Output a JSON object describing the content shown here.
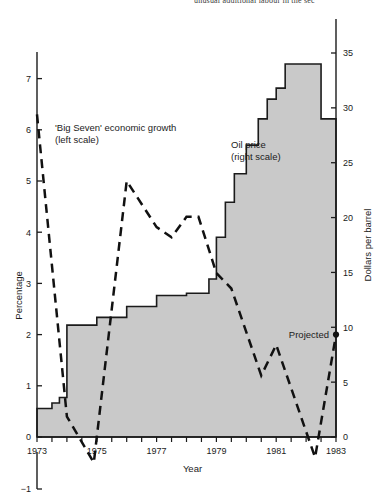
{
  "header": {
    "clipped_text": "unusual additional labour in the sec"
  },
  "chart_data": {
    "type": "area",
    "title": "",
    "xlabel": "Year",
    "ylabel": "Percentage",
    "y2label": "Dollars per barrel",
    "grid": false,
    "legend_position": "inline-annotations",
    "x": [
      1973,
      1974,
      1975,
      1976,
      1977,
      1978,
      1979,
      1980,
      1981,
      1982,
      1983
    ],
    "xlim": [
      1973,
      1983
    ],
    "xtick_labels": [
      "1973",
      "1975",
      "1977",
      "1979",
      "1981",
      "1983"
    ],
    "xticks_minor_per_year": 2,
    "ylim": [
      -1,
      7.5
    ],
    "ytick_labels": [
      "-1",
      "0",
      "1",
      "2",
      "3",
      "4",
      "5",
      "6",
      "7"
    ],
    "y2lim": [
      0,
      35
    ],
    "y2tick_labels": [
      "0",
      "5",
      "10",
      "15",
      "20",
      "25",
      "30",
      "35"
    ],
    "series": [
      {
        "name": "Oil price",
        "type": "step-area",
        "axis": "right",
        "units": "Dollars per barrel",
        "fill_color": "#c9c9c9",
        "line_color": "#1b1b1b",
        "annotation": "Oil price\n(right scale)",
        "steps": [
          {
            "x": 1973.0,
            "value": 2.6
          },
          {
            "x": 1973.5,
            "value": 3.1
          },
          {
            "x": 1973.75,
            "value": 3.6
          },
          {
            "x": 1974.0,
            "value": 10.2
          },
          {
            "x": 1975.0,
            "value": 10.9
          },
          {
            "x": 1976.0,
            "value": 11.9
          },
          {
            "x": 1977.0,
            "value": 12.9
          },
          {
            "x": 1978.0,
            "value": 13.1
          },
          {
            "x": 1978.75,
            "value": 14.4
          },
          {
            "x": 1979.0,
            "value": 18.2
          },
          {
            "x": 1979.3,
            "value": 21.4
          },
          {
            "x": 1979.6,
            "value": 24.0
          },
          {
            "x": 1980.0,
            "value": 26.6
          },
          {
            "x": 1980.4,
            "value": 29.0
          },
          {
            "x": 1980.7,
            "value": 30.8
          },
          {
            "x": 1981.0,
            "value": 31.8
          },
          {
            "x": 1981.3,
            "value": 34.0
          },
          {
            "x": 1982.4,
            "value": 34.0
          },
          {
            "x": 1982.5,
            "value": 29.0
          },
          {
            "x": 1983.0,
            "value": 29.0
          }
        ]
      },
      {
        "name": "'Big Seven' economic growth",
        "type": "line-dashed",
        "axis": "left",
        "units": "Percentage",
        "line_color": "#111111",
        "annotation": "'Big Seven' economic growth\n(left scale)",
        "points": [
          {
            "x": 1973.0,
            "value": 6.3
          },
          {
            "x": 1974.0,
            "value": 0.4
          },
          {
            "x": 1974.9,
            "value": -0.5
          },
          {
            "x": 1976.0,
            "value": 5.0
          },
          {
            "x": 1977.0,
            "value": 4.1
          },
          {
            "x": 1977.5,
            "value": 3.9
          },
          {
            "x": 1978.0,
            "value": 4.3
          },
          {
            "x": 1978.4,
            "value": 4.3
          },
          {
            "x": 1979.0,
            "value": 3.2
          },
          {
            "x": 1979.5,
            "value": 2.9
          },
          {
            "x": 1980.5,
            "value": 1.2
          },
          {
            "x": 1981.0,
            "value": 1.8
          },
          {
            "x": 1982.3,
            "value": -0.4
          },
          {
            "x": 1983.0,
            "value": 2.0
          }
        ],
        "projected_label": "Projected",
        "projected_point": {
          "x": 1983.0,
          "value": 2.0
        }
      }
    ]
  }
}
